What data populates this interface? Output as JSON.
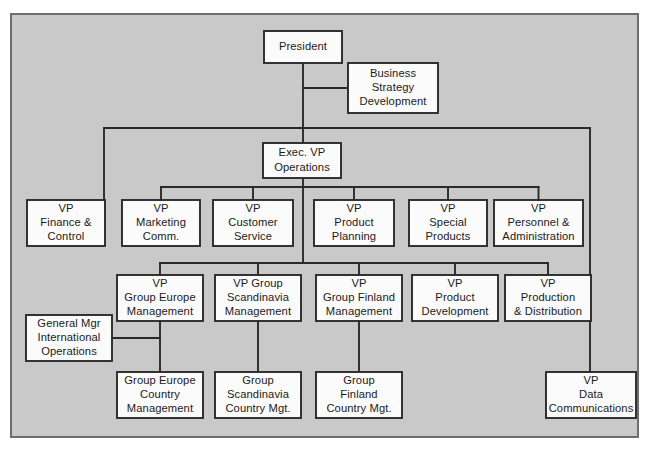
{
  "diagram": {
    "type": "organizational-chart",
    "frame": {
      "fill": "#c9c9c9",
      "border": "#6e6e6e"
    },
    "node_fill": "#fbfbfb",
    "line_color": "#2a2a2a",
    "nodes": [
      {
        "id": "president",
        "lines": [
          "President"
        ],
        "x": 264,
        "y": 31,
        "w": 78,
        "h": 32
      },
      {
        "id": "business-strategy",
        "lines": [
          "Business",
          "Strategy",
          "Development"
        ],
        "x": 348,
        "y": 63,
        "w": 90,
        "h": 50
      },
      {
        "id": "exec-vp-ops",
        "lines": [
          "Exec. VP",
          "Operations"
        ],
        "x": 263,
        "y": 143,
        "w": 78,
        "h": 35
      },
      {
        "id": "vp-finance",
        "lines": [
          "VP",
          "Finance &",
          "Control"
        ],
        "x": 27,
        "y": 200,
        "w": 78,
        "h": 46
      },
      {
        "id": "vp-marketing",
        "lines": [
          "VP",
          "Marketing",
          "Comm."
        ],
        "x": 122,
        "y": 200,
        "w": 78,
        "h": 46
      },
      {
        "id": "vp-customer",
        "lines": [
          "VP",
          "Customer",
          "Service"
        ],
        "x": 213,
        "y": 200,
        "w": 80,
        "h": 46
      },
      {
        "id": "vp-product-plan",
        "lines": [
          "VP",
          "Product",
          "Planning"
        ],
        "x": 314,
        "y": 200,
        "w": 80,
        "h": 46
      },
      {
        "id": "vp-special",
        "lines": [
          "VP",
          "Special",
          "Products"
        ],
        "x": 409,
        "y": 200,
        "w": 78,
        "h": 46
      },
      {
        "id": "vp-personnel",
        "lines": [
          "VP",
          "Personnel &",
          "Administration"
        ],
        "x": 494,
        "y": 200,
        "w": 89,
        "h": 46
      },
      {
        "id": "vp-group-europe",
        "lines": [
          "VP",
          "Group Europe",
          "Management"
        ],
        "x": 117,
        "y": 275,
        "w": 86,
        "h": 46
      },
      {
        "id": "vp-group-scand",
        "lines": [
          "VP Group",
          "Scandinavia",
          "Management"
        ],
        "x": 215,
        "y": 275,
        "w": 86,
        "h": 46
      },
      {
        "id": "vp-group-finland",
        "lines": [
          "VP",
          "Group Finland",
          "Management"
        ],
        "x": 316,
        "y": 275,
        "w": 86,
        "h": 46
      },
      {
        "id": "vp-product-dev",
        "lines": [
          "VP",
          "Product",
          "Development"
        ],
        "x": 412,
        "y": 275,
        "w": 86,
        "h": 46
      },
      {
        "id": "vp-production",
        "lines": [
          "VP",
          "Production",
          "& Distribution"
        ],
        "x": 505,
        "y": 275,
        "w": 86,
        "h": 46
      },
      {
        "id": "general-mgr",
        "lines": [
          "General Mgr",
          "International",
          "Operations"
        ],
        "x": 26,
        "y": 315,
        "w": 86,
        "h": 46
      },
      {
        "id": "group-europe-ctry",
        "lines": [
          "Group Europe",
          "Country",
          "Management"
        ],
        "x": 117,
        "y": 372,
        "w": 86,
        "h": 46
      },
      {
        "id": "group-scand-ctry",
        "lines": [
          "Group",
          "Scandinavia",
          "Country Mgt."
        ],
        "x": 215,
        "y": 372,
        "w": 86,
        "h": 46
      },
      {
        "id": "group-finland-ctry",
        "lines": [
          "Group",
          "Finland",
          "Country Mgt."
        ],
        "x": 316,
        "y": 372,
        "w": 86,
        "h": 46
      },
      {
        "id": "vp-data-comm",
        "lines": [
          "VP",
          "Data",
          "Communications"
        ],
        "x": 546,
        "y": 372,
        "w": 90,
        "h": 46
      }
    ],
    "edges": [
      {
        "from": "president",
        "to": "business-strategy",
        "kind": "elbow-right"
      },
      {
        "from": "president",
        "to": "exec-vp-ops",
        "kind": "vertical"
      },
      {
        "from": "exec-vp-ops",
        "to": "vp-finance",
        "kind": "top-bus-left"
      },
      {
        "from": "exec-vp-ops",
        "to": "vp-data-comm",
        "kind": "top-bus-right"
      },
      {
        "from": "exec-vp-ops",
        "to": "vp-marketing",
        "kind": "bus"
      },
      {
        "from": "exec-vp-ops",
        "to": "vp-customer",
        "kind": "bus"
      },
      {
        "from": "exec-vp-ops",
        "to": "vp-product-plan",
        "kind": "bus"
      },
      {
        "from": "exec-vp-ops",
        "to": "vp-special",
        "kind": "bus"
      },
      {
        "from": "exec-vp-ops",
        "to": "vp-personnel",
        "kind": "bus"
      },
      {
        "from": "exec-vp-ops",
        "to": "vp-group-europe",
        "kind": "bus2"
      },
      {
        "from": "exec-vp-ops",
        "to": "vp-group-scand",
        "kind": "bus2"
      },
      {
        "from": "exec-vp-ops",
        "to": "vp-group-finland",
        "kind": "bus2"
      },
      {
        "from": "exec-vp-ops",
        "to": "vp-product-dev",
        "kind": "bus2"
      },
      {
        "from": "exec-vp-ops",
        "to": "vp-production",
        "kind": "bus2"
      },
      {
        "from": "vp-group-europe",
        "to": "group-europe-ctry",
        "kind": "vertical"
      },
      {
        "from": "vp-group-scand",
        "to": "group-scand-ctry",
        "kind": "vertical"
      },
      {
        "from": "vp-group-finland",
        "to": "group-finland-ctry",
        "kind": "vertical"
      },
      {
        "from": "general-mgr",
        "to": "group-europe-ctry",
        "kind": "side-tap"
      }
    ]
  }
}
